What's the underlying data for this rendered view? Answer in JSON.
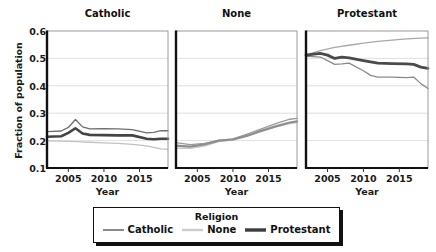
{
  "chart_data": {
    "type": "line",
    "title": "",
    "xlabel": "Year",
    "ylabel": "Fraction of population",
    "xlim": [
      2002,
      2019
    ],
    "ylim": [
      0.1,
      0.6
    ],
    "yticks": [
      "0.6",
      "0.5",
      "0.4",
      "0.3",
      "0.2",
      "0.1"
    ],
    "ytick_values": [
      0.6,
      0.5,
      0.4,
      0.3,
      0.2,
      0.1
    ],
    "xticks": [
      "2005",
      "2010",
      "2015"
    ],
    "xtick_values": [
      2005,
      2010,
      2015
    ],
    "grid": true,
    "legend_position": "bottom",
    "legend_title": "Religion",
    "panels": [
      {
        "title": "Catholic",
        "series": [
          {
            "name": "Catholic",
            "color": "#6e6e6e",
            "width": 1.3,
            "x": [
              2002,
              2004,
              2005,
              2006,
              2007,
              2008,
              2010,
              2012,
              2014,
              2016,
              2017,
              2018,
              2019
            ],
            "values": [
              0.233,
              0.235,
              0.248,
              0.277,
              0.25,
              0.243,
              0.244,
              0.243,
              0.24,
              0.228,
              0.23,
              0.236,
              0.236
            ]
          },
          {
            "name": "None",
            "color": "#c2c2c2",
            "width": 1.3,
            "x": [
              2002,
              2004,
              2006,
              2008,
              2010,
              2012,
              2014,
              2016,
              2018,
              2019
            ],
            "values": [
              0.199,
              0.198,
              0.196,
              0.194,
              0.192,
              0.19,
              0.186,
              0.181,
              0.17,
              0.168
            ]
          },
          {
            "name": "Protestant",
            "color": "#444444",
            "width": 2.6,
            "x": [
              2002,
              2004,
              2005,
              2006,
              2007,
              2008,
              2010,
              2012,
              2014,
              2016,
              2017,
              2018,
              2019
            ],
            "values": [
              0.214,
              0.216,
              0.228,
              0.245,
              0.226,
              0.221,
              0.22,
              0.219,
              0.219,
              0.207,
              0.205,
              0.207,
              0.207
            ]
          }
        ]
      },
      {
        "title": "None",
        "series": [
          {
            "name": "Catholic",
            "color": "#9a9a9a",
            "width": 1.3,
            "x": [
              2002,
              2004,
              2006,
              2008,
              2010,
              2012,
              2014,
              2016,
              2018,
              2019
            ],
            "values": [
              0.193,
              0.185,
              0.19,
              0.201,
              0.206,
              0.224,
              0.243,
              0.262,
              0.278,
              0.281
            ]
          },
          {
            "name": "None",
            "color": "#c8c8c8",
            "width": 1.3,
            "x": [
              2002,
              2004,
              2006,
              2008,
              2010,
              2012,
              2014,
              2016,
              2018,
              2019
            ],
            "values": [
              0.172,
              0.172,
              0.18,
              0.196,
              0.203,
              0.216,
              0.233,
              0.25,
              0.262,
              0.266
            ]
          },
          {
            "name": "Protestant",
            "color": "#8e8e8e",
            "width": 2.2,
            "x": [
              2002,
              2004,
              2006,
              2008,
              2010,
              2012,
              2014,
              2016,
              2018,
              2019
            ],
            "values": [
              0.182,
              0.178,
              0.186,
              0.2,
              0.204,
              0.218,
              0.236,
              0.252,
              0.266,
              0.27
            ]
          }
        ]
      },
      {
        "title": "Protestant",
        "series": [
          {
            "name": "Catholic",
            "color": "#a8a8a8",
            "width": 1.3,
            "x": [
              2002,
              2004,
              2006,
              2008,
              2010,
              2012,
              2014,
              2016,
              2018,
              2019
            ],
            "values": [
              0.513,
              0.528,
              0.54,
              0.548,
              0.556,
              0.562,
              0.567,
              0.571,
              0.574,
              0.575
            ]
          },
          {
            "name": "None",
            "color": "#8a8a8a",
            "width": 1.3,
            "x": [
              2002,
              2004,
              2005,
              2006,
              2007,
              2008,
              2010,
              2011,
              2012,
              2014,
              2016,
              2017,
              2018,
              2019
            ],
            "values": [
              0.508,
              0.505,
              0.492,
              0.478,
              0.48,
              0.483,
              0.455,
              0.438,
              0.432,
              0.432,
              0.43,
              0.432,
              0.408,
              0.39
            ]
          },
          {
            "name": "Protestant",
            "color": "#4a4a4a",
            "width": 2.8,
            "x": [
              2002,
              2004,
              2005,
              2006,
              2007,
              2008,
              2010,
              2012,
              2014,
              2016,
              2017,
              2018,
              2019
            ],
            "values": [
              0.512,
              0.518,
              0.512,
              0.5,
              0.505,
              0.502,
              0.492,
              0.483,
              0.481,
              0.48,
              0.478,
              0.468,
              0.464
            ]
          }
        ]
      }
    ],
    "legend_entries": [
      {
        "label": "Catholic",
        "color": "#6e6e6e",
        "width": 1.6
      },
      {
        "label": "None",
        "color": "#cccccc",
        "width": 2.4
      },
      {
        "label": "Protestant",
        "color": "#3d3d3d",
        "width": 3.4
      }
    ]
  }
}
